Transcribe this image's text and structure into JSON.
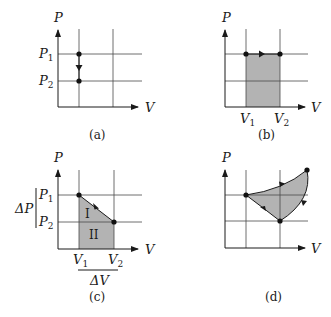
{
  "colors": {
    "shade": "#b3b3b3",
    "ink": "#1a1a1a",
    "grid": "#4a4a4a"
  },
  "panels": {
    "a": {
      "caption": "(a)",
      "y_axis_label": "P",
      "x_axis_label": "V",
      "p1_label": "P",
      "p1_sub": "1",
      "p2_label": "P",
      "p2_sub": "2",
      "description": "Isochoric process: pressure drops from P1 to P2 at constant volume"
    },
    "b": {
      "caption": "(b)",
      "y_axis_label": "P",
      "x_axis_label": "V",
      "v1_label": "V",
      "v1_sub": "1",
      "v2_label": "V",
      "v2_sub": "2",
      "description": "Isobaric expansion from V1 to V2; shaded area is work"
    },
    "c": {
      "caption": "(c)",
      "y_axis_label": "P",
      "x_axis_label": "V",
      "p1_label": "P",
      "p1_sub": "1",
      "p2_label": "P",
      "p2_sub": "2",
      "v1_label": "V",
      "v1_sub": "1",
      "v2_label": "V",
      "v2_sub": "2",
      "delta_p_label": "ΔP",
      "delta_v_label": "ΔV",
      "region_1_label": "I",
      "region_2_label": "II",
      "description": "Linear process from (V1,P1) to (V2,P2); area split into triangle I and rectangle II"
    },
    "d": {
      "caption": "(d)",
      "y_axis_label": "P",
      "x_axis_label": "V",
      "description": "Cyclic process; enclosed shaded area is net work"
    }
  }
}
